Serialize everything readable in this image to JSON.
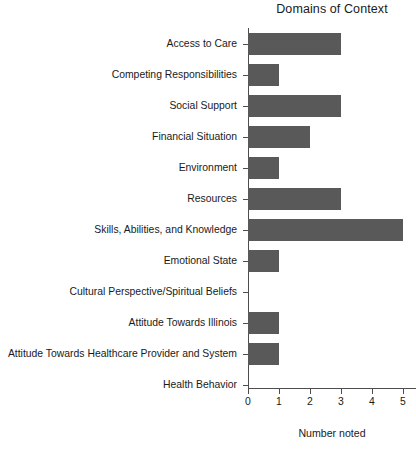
{
  "chart_data": {
    "type": "bar",
    "orientation": "horizontal",
    "title": "Domains of Context",
    "xlabel": "Number noted",
    "ylabel": "",
    "xlim": [
      0,
      5
    ],
    "xticks": [
      0,
      1,
      2,
      3,
      4,
      5
    ],
    "xtick_labels": [
      "0",
      "1",
      "2",
      "3",
      "4",
      "5"
    ],
    "grid": false,
    "legend": null,
    "bar_color": "#595959",
    "axis_color": "#4d4d4d",
    "background": "#ffffff",
    "categories": [
      "Access to Care",
      "Competing Responsibilities",
      "Social Support",
      "Financial Situation",
      "Environment",
      "Resources",
      "Skills, Abilities, and Knowledge",
      "Emotional State",
      "Cultural Perspective/Spiritual Beliefs",
      "Attitude Towards Illinois",
      "Attitude Towards Healthcare Provider and System",
      "Health Behavior"
    ],
    "values": [
      3,
      1,
      3,
      2,
      1,
      3,
      5,
      1,
      0,
      1,
      1,
      0
    ]
  }
}
